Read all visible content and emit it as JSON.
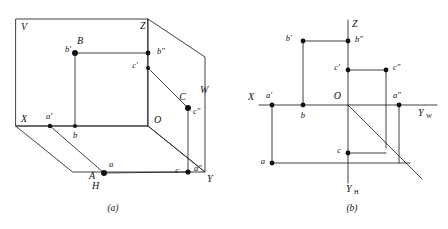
{
  "figure": {
    "captions": [
      {
        "id": "caption-a",
        "text": "(a)",
        "x": 113,
        "y": 211
      },
      {
        "id": "caption-b",
        "text": "(b)",
        "x": 352,
        "y": 211
      }
    ]
  },
  "diagram_a": {
    "name": "pictorial-three-plane-view",
    "axis_labels": [
      {
        "id": "label-V",
        "text": "V",
        "x": 21,
        "y": 28
      },
      {
        "id": "label-Z",
        "text": "Z",
        "x": 140,
        "y": 27
      },
      {
        "id": "label-W",
        "text": "W",
        "x": 200,
        "y": 91
      },
      {
        "id": "label-X",
        "text": "X",
        "x": 21,
        "y": 120
      },
      {
        "id": "label-O",
        "text": "O",
        "x": 154,
        "y": 121
      },
      {
        "id": "label-Y",
        "text": "Y",
        "x": 207,
        "y": 180
      },
      {
        "id": "label-H",
        "text": "H",
        "x": 92,
        "y": 187
      }
    ],
    "points": [
      {
        "id": "point-B",
        "label": "B",
        "x": 75,
        "y": 53,
        "lx": 77,
        "ly": 42,
        "dot": true
      },
      {
        "id": "point-b-prime",
        "label": "b′",
        "x": 75,
        "y": 53,
        "lx": 65,
        "ly": 50,
        "dot": false
      },
      {
        "id": "point-b2",
        "label": "b″",
        "x": 148,
        "y": 53,
        "lx": 157,
        "ly": 52,
        "dot": true
      },
      {
        "id": "point-c-prime",
        "label": "c′",
        "x": 148,
        "y": 68,
        "lx": 138,
        "ly": 66,
        "dot": true
      },
      {
        "id": "point-C",
        "label": "C",
        "x": 188,
        "y": 108,
        "lx": 186,
        "ly": 98,
        "dot": false
      },
      {
        "id": "point-c2",
        "label": "c″",
        "x": 188,
        "y": 108,
        "lx": 196,
        "ly": 112,
        "dot": true
      },
      {
        "id": "point-a-prime",
        "label": "a′",
        "x": 50,
        "y": 126,
        "lx": 49,
        "ly": 117,
        "dot": true
      },
      {
        "id": "point-b",
        "label": "b",
        "x": 75,
        "y": 126,
        "lx": 75,
        "ly": 135,
        "dot": true
      },
      {
        "id": "point-a",
        "label": "a",
        "x": 104,
        "y": 173,
        "lx": 107,
        "ly": 165,
        "dot": true
      },
      {
        "id": "point-A",
        "label": "A",
        "x": 104,
        "y": 173,
        "lx": 95,
        "ly": 177,
        "dot": false
      },
      {
        "id": "point-c",
        "label": "c",
        "x": 188,
        "y": 172,
        "lx": 181,
        "ly": 171,
        "dot": false
      },
      {
        "id": "point-a2",
        "label": "a″",
        "x": 188,
        "y": 172,
        "lx": 196,
        "ly": 169,
        "dot": true
      }
    ]
  },
  "diagram_b": {
    "name": "unfolded-projection-view",
    "axis_labels": [
      {
        "id": "label-Z-b",
        "text": "Z",
        "x": 352,
        "y": 25,
        "sub": ""
      },
      {
        "id": "label-X-b",
        "text": "X",
        "x": 251,
        "y": 98,
        "sub": ""
      },
      {
        "id": "label-O-b",
        "text": "O",
        "x": 341,
        "y": 97,
        "sub": ""
      },
      {
        "id": "label-YW",
        "text": "Y",
        "x": 422,
        "y": 114,
        "sub": "W"
      },
      {
        "id": "label-YH",
        "text": "Y",
        "x": 350,
        "y": 190,
        "sub": "H"
      }
    ],
    "points": [
      {
        "id": "point-b-prime-b",
        "label": "b′",
        "x": 303,
        "y": 41,
        "lx": 294,
        "ly": 39
      },
      {
        "id": "point-b2-b",
        "label": "b″",
        "x": 348,
        "y": 41,
        "lx": 357,
        "ly": 40
      },
      {
        "id": "point-c-prime-b",
        "label": "c′",
        "x": 348,
        "y": 70,
        "lx": 339,
        "ly": 68
      },
      {
        "id": "point-c2-b",
        "label": "c″",
        "x": 386,
        "y": 70,
        "lx": 394,
        "ly": 68
      },
      {
        "id": "point-a-prime-b",
        "label": "a′",
        "x": 272,
        "y": 105,
        "lx": 271,
        "ly": 96
      },
      {
        "id": "point-b-b",
        "label": "b",
        "x": 303,
        "y": 105,
        "lx": 303,
        "ly": 115
      },
      {
        "id": "point-a2-b",
        "label": "a″",
        "x": 399,
        "y": 105,
        "lx": 399,
        "ly": 96
      },
      {
        "id": "point-c-b",
        "label": "c",
        "x": 348,
        "y": 153,
        "lx": 340,
        "ly": 151
      },
      {
        "id": "point-a-b",
        "label": "a",
        "x": 272,
        "y": 163,
        "lx": 263,
        "ly": 162
      }
    ]
  },
  "colors": {
    "stroke": "#2b2b2b",
    "dot": "#111111",
    "background": "#ffffff"
  }
}
